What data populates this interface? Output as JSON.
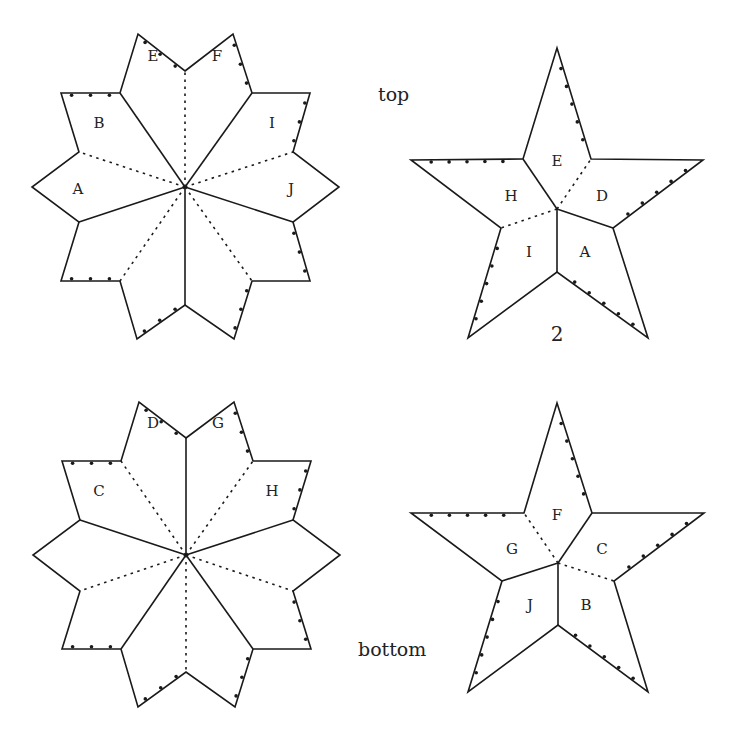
{
  "figure": {
    "captions": [
      {
        "id": "top",
        "text": "top",
        "x": 378,
        "y": 101
      },
      {
        "id": "bottom",
        "text": "bottom",
        "x": 358,
        "y": 656
      }
    ],
    "number_label": {
      "text": "2",
      "x": 557,
      "y": 341
    },
    "colors": {
      "stroke": "#1a1a1a",
      "fill": "#ffffff",
      "text": "#222222"
    }
  },
  "shapes": [
    {
      "id": "top-decagon-star",
      "kind": "ten-point-star",
      "center": [
        185,
        187
      ],
      "vertices": [
        [
          185,
          71
        ],
        [
          233,
          34
        ],
        [
          252,
          93
        ],
        [
          310,
          93
        ],
        [
          293,
          152
        ],
        [
          339,
          187
        ],
        [
          293,
          222
        ],
        [
          310,
          281
        ],
        [
          252,
          281
        ],
        [
          234,
          339
        ],
        [
          185,
          305
        ],
        [
          137,
          339
        ],
        [
          120,
          281
        ],
        [
          61,
          281
        ],
        [
          79,
          222
        ],
        [
          32,
          187
        ],
        [
          79,
          152
        ],
        [
          61,
          93
        ],
        [
          120,
          93
        ],
        [
          138,
          34
        ]
      ],
      "solid_spokes_to": [
        2,
        6,
        10,
        14,
        18
      ],
      "dashed_spokes_to": [
        0,
        4,
        8,
        12,
        16
      ],
      "tick_edges": [
        [
          19,
          0
        ],
        [
          1,
          2
        ],
        [
          3,
          4
        ],
        [
          6,
          7
        ],
        [
          8,
          9
        ],
        [
          10,
          11
        ],
        [
          12,
          13
        ],
        [
          17,
          18
        ]
      ],
      "ticks_per_edge": 3,
      "labels": [
        {
          "text": "E",
          "x": 153,
          "y": 56
        },
        {
          "text": "F",
          "x": 217,
          "y": 56
        },
        {
          "text": "B",
          "x": 99,
          "y": 123
        },
        {
          "text": "I",
          "x": 272,
          "y": 123
        },
        {
          "text": "A",
          "x": 78,
          "y": 189
        },
        {
          "text": "J",
          "x": 291,
          "y": 189
        }
      ]
    },
    {
      "id": "top-five-point-star",
      "kind": "five-point-star",
      "center": [
        557,
        209
      ],
      "vertices": [
        [
          557,
          48
        ],
        [
          591,
          159
        ],
        [
          703,
          160
        ],
        [
          613,
          228
        ],
        [
          648,
          338
        ],
        [
          557,
          272
        ],
        [
          468,
          338
        ],
        [
          501,
          228
        ],
        [
          411,
          160
        ],
        [
          523,
          159
        ]
      ],
      "solid_spokes_to": [
        9,
        3,
        5
      ],
      "dashed_spokes_to": [
        1,
        7
      ],
      "tick_edges": [
        [
          0,
          1
        ],
        [
          8,
          9
        ],
        [
          2,
          3
        ],
        [
          3,
          4
        ],
        [
          5,
          4
        ],
        [
          7,
          6
        ]
      ],
      "tick_edges_override": [
        [
          0,
          1
        ],
        [
          8,
          9
        ],
        [
          2,
          3
        ],
        [
          5,
          4
        ],
        [
          7,
          6
        ]
      ],
      "ticks_per_edge": 5,
      "labels": [
        {
          "text": "E",
          "x": 557,
          "y": 161
        },
        {
          "text": "H",
          "x": 511,
          "y": 196
        },
        {
          "text": "D",
          "x": 602,
          "y": 196
        },
        {
          "text": "I",
          "x": 529,
          "y": 252
        },
        {
          "text": "A",
          "x": 585,
          "y": 252
        }
      ]
    },
    {
      "id": "bottom-decagon-star",
      "kind": "ten-point-star",
      "center": [
        186,
        555
      ],
      "vertices": [
        [
          186,
          438
        ],
        [
          234,
          402
        ],
        [
          253,
          461
        ],
        [
          311,
          461
        ],
        [
          293,
          520
        ],
        [
          340,
          555
        ],
        [
          293,
          591
        ],
        [
          311,
          649
        ],
        [
          253,
          649
        ],
        [
          235,
          707
        ],
        [
          186,
          672
        ],
        [
          138,
          707
        ],
        [
          121,
          649
        ],
        [
          62,
          649
        ],
        [
          80,
          591
        ],
        [
          33,
          555
        ],
        [
          80,
          520
        ],
        [
          62,
          461
        ],
        [
          121,
          461
        ],
        [
          139,
          402
        ]
      ],
      "solid_spokes_to": [
        0,
        4,
        8,
        12,
        16
      ],
      "dashed_spokes_to": [
        2,
        6,
        10,
        14,
        18
      ],
      "tick_edges": [
        [
          19,
          0
        ],
        [
          1,
          2
        ],
        [
          3,
          4
        ],
        [
          6,
          7
        ],
        [
          8,
          9
        ],
        [
          10,
          11
        ],
        [
          12,
          13
        ],
        [
          17,
          18
        ]
      ],
      "ticks_per_edge": 3,
      "labels": [
        {
          "text": "D",
          "x": 153,
          "y": 423
        },
        {
          "text": "G",
          "x": 218,
          "y": 423
        },
        {
          "text": "C",
          "x": 99,
          "y": 491
        },
        {
          "text": "H",
          "x": 272,
          "y": 491
        }
      ]
    },
    {
      "id": "bottom-five-point-star",
      "kind": "five-point-star",
      "center": [
        558,
        563
      ],
      "vertices": [
        [
          557,
          403
        ],
        [
          592,
          513
        ],
        [
          704,
          513
        ],
        [
          614,
          581
        ],
        [
          648,
          692
        ],
        [
          558,
          625
        ],
        [
          468,
          692
        ],
        [
          502,
          581
        ],
        [
          411,
          513
        ],
        [
          524,
          513
        ]
      ],
      "solid_spokes_to": [
        1,
        7,
        5
      ],
      "dashed_spokes_to": [
        9,
        3
      ],
      "tick_edges": [
        [
          0,
          1
        ],
        [
          8,
          9
        ],
        [
          2,
          3
        ],
        [
          5,
          4
        ],
        [
          7,
          6
        ]
      ],
      "ticks_per_edge": 5,
      "labels": [
        {
          "text": "F",
          "x": 557,
          "y": 515
        },
        {
          "text": "G",
          "x": 512,
          "y": 549
        },
        {
          "text": "C",
          "x": 602,
          "y": 549
        },
        {
          "text": "J",
          "x": 530,
          "y": 605
        },
        {
          "text": "B",
          "x": 586,
          "y": 605
        }
      ]
    }
  ]
}
